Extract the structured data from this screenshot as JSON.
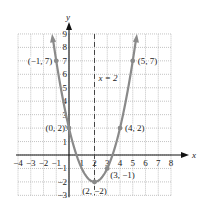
{
  "chart_data": {
    "type": "line",
    "title": "",
    "equation_hint": "parabola y = x^2 - 4x + 2",
    "xlabel": "x",
    "ylabel": "y",
    "xlim": [
      -4,
      8
    ],
    "ylim": [
      -3,
      9
    ],
    "grid": true,
    "x_ticks": [
      "-4",
      "-3",
      "-2",
      "-1",
      "1",
      "2",
      "3",
      "4",
      "5",
      "6",
      "7",
      "8"
    ],
    "y_ticks": [
      "-3",
      "-2",
      "-1",
      "1",
      "2",
      "3",
      "4",
      "5",
      "6",
      "7",
      "8",
      "9"
    ],
    "series": [
      {
        "name": "parabola",
        "color": "#8a8a8a",
        "x": [
          -1.2,
          -1,
          0,
          1,
          2,
          3,
          4,
          5,
          5.2
        ],
        "y": [
          8.24,
          7,
          2,
          -1,
          -2,
          -1,
          2,
          7,
          8.24
        ]
      }
    ],
    "points": [
      {
        "x": -1,
        "y": 7,
        "label": "(−1, 7)"
      },
      {
        "x": 0,
        "y": 2,
        "label": "(0, 2)"
      },
      {
        "x": 2,
        "y": -2,
        "label": "(2, −2)"
      },
      {
        "x": 3,
        "y": -1,
        "label": "(3, −1)"
      },
      {
        "x": 4,
        "y": 2,
        "label": "(4, 2)"
      },
      {
        "x": 5,
        "y": 7,
        "label": "(5, 7)"
      }
    ],
    "annotations": [
      {
        "type": "vertical-dashed-line",
        "x": 2,
        "label": "x = 2"
      }
    ]
  },
  "labels": {
    "x_axis": "x",
    "y_axis": "y",
    "axis_of_symmetry": "x = 2"
  }
}
